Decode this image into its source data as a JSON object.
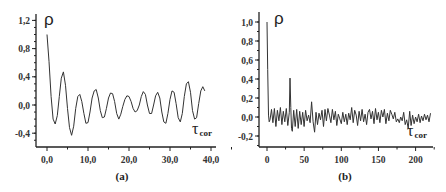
{
  "chart_data": [
    {
      "panel": "(a)",
      "type": "line",
      "title": "",
      "ylabel": "ρ",
      "xlabel": "τcor",
      "xlabel_main": "τ",
      "xlabel_sub": "cor",
      "xlim": [
        -1.5,
        41
      ],
      "ylim": [
        -0.55,
        1.3
      ],
      "xticks": [
        0,
        10,
        20,
        30,
        40
      ],
      "xtick_labels": [
        "0,0",
        "10,0",
        "20,0",
        "30,0",
        "40,0"
      ],
      "yticks": [
        1.2,
        0.8,
        0.4,
        0.0,
        -0.4
      ],
      "ytick_labels": [
        "1,2",
        "0,8",
        "0,4",
        "0,0",
        "-0,4"
      ],
      "grid": false,
      "x": [
        0,
        0.5,
        1,
        1.5,
        2,
        2.5,
        3,
        3.5,
        4,
        4.5,
        5,
        5.5,
        6,
        6.5,
        7,
        7.5,
        8,
        8.5,
        9,
        9.5,
        10,
        10.5,
        11,
        11.5,
        12,
        12.5,
        13,
        13.5,
        14,
        14.5,
        15,
        15.5,
        16,
        16.5,
        17,
        17.5,
        18,
        18.5,
        19,
        19.5,
        20,
        20.5,
        21,
        21.5,
        22,
        22.5,
        23,
        23.5,
        24,
        24.5,
        25,
        25.5,
        26,
        26.5,
        27,
        27.5,
        28,
        28.5,
        29,
        29.5,
        30,
        30.5,
        31,
        31.5,
        32,
        32.5,
        33,
        33.5,
        34,
        34.5,
        35,
        35.5,
        36,
        36.5,
        37,
        37.5,
        38,
        38.5,
        39,
        39.5,
        40
      ],
      "values": [
        1.0,
        0.62,
        0.12,
        -0.2,
        -0.27,
        -0.15,
        0.12,
        0.38,
        0.47,
        0.28,
        -0.05,
        -0.32,
        -0.43,
        -0.3,
        -0.05,
        0.12,
        0.15,
        0.05,
        -0.12,
        -0.26,
        -0.25,
        -0.1,
        0.1,
        0.2,
        0.22,
        0.1,
        -0.08,
        -0.18,
        -0.17,
        -0.05,
        0.1,
        0.17,
        0.16,
        0.05,
        -0.12,
        -0.2,
        -0.13,
        -0.02,
        0.08,
        0.13,
        0.12,
        0.05,
        -0.05,
        -0.1,
        -0.08,
        0.0,
        0.12,
        0.19,
        0.15,
        0.0,
        -0.12,
        -0.12,
        0.0,
        0.13,
        0.18,
        0.1,
        -0.1,
        -0.24,
        -0.26,
        -0.12,
        0.08,
        0.2,
        0.18,
        0.02,
        -0.18,
        -0.24,
        -0.12,
        0.12,
        0.3,
        0.33,
        0.18,
        -0.08,
        -0.2,
        -0.18,
        0.02,
        0.2,
        0.26,
        0.2
      ],
      "legend": []
    },
    {
      "panel": "(b)",
      "type": "line",
      "title": "",
      "ylabel": "ρ",
      "xlabel": "τcor",
      "xlabel_main": "τ",
      "xlabel_sub": "cor",
      "xlim": [
        -10,
        222
      ],
      "ylim": [
        -0.3,
        1.1
      ],
      "xticks": [
        0,
        50,
        100,
        150,
        200
      ],
      "xtick_labels": [
        "0",
        "50",
        "100",
        "150",
        "200"
      ],
      "yticks": [
        1.0,
        0.8,
        0.6,
        0.4,
        0.2,
        0.0,
        -0.2
      ],
      "ytick_labels": [
        "1,0",
        "0,8",
        "0,6",
        "0,4",
        "0,2",
        "0,0",
        "-0,2"
      ],
      "grid": false,
      "x": [
        0,
        1,
        2,
        3,
        4,
        6,
        8,
        10,
        12,
        14,
        16,
        18,
        20,
        22,
        24,
        26,
        28,
        30,
        31,
        32,
        33,
        34,
        36,
        38,
        40,
        42,
        44,
        46,
        48,
        50,
        52,
        54,
        56,
        58,
        60,
        62,
        64,
        66,
        68,
        70,
        72,
        74,
        76,
        78,
        80,
        82,
        84,
        86,
        88,
        90,
        92,
        94,
        96,
        98,
        100,
        102,
        104,
        106,
        108,
        110,
        112,
        114,
        116,
        118,
        120,
        122,
        124,
        126,
        128,
        130,
        132,
        134,
        136,
        138,
        140,
        142,
        144,
        146,
        148,
        150,
        152,
        154,
        156,
        158,
        160,
        162,
        164,
        166,
        168,
        170,
        172,
        174,
        176,
        178,
        180,
        182,
        184,
        186,
        188,
        190,
        192,
        194,
        196,
        198,
        200,
        202,
        204,
        206,
        208,
        210,
        212,
        214,
        216,
        218,
        220
      ],
      "values": [
        1.0,
        0.5,
        0.02,
        -0.05,
        -0.03,
        0.08,
        -0.06,
        0.09,
        -0.1,
        0.07,
        -0.04,
        0.1,
        -0.08,
        0.06,
        -0.05,
        0.09,
        -0.09,
        0.05,
        0.41,
        0.1,
        -0.12,
        -0.15,
        0.07,
        -0.1,
        0.08,
        -0.12,
        0.06,
        -0.08,
        0.05,
        -0.1,
        0.07,
        -0.04,
        0.02,
        -0.06,
        0.16,
        -0.05,
        -0.16,
        0.05,
        -0.08,
        0.04,
        -0.03,
        0.07,
        -0.1,
        0.08,
        -0.04,
        0.09,
        0.02,
        -0.06,
        0.08,
        -0.03,
        0.06,
        -0.09,
        0.03,
        -0.02,
        -0.07,
        0.05,
        -0.05,
        0.03,
        -0.08,
        0.04,
        -0.03,
        0.1,
        -0.06,
        0.07,
        0.02,
        -0.09,
        0.06,
        -0.04,
        0.08,
        -0.05,
        0.03,
        -0.08,
        0.05,
        0.08,
        -0.02,
        0.06,
        -0.07,
        0.09,
        -0.03,
        0.05,
        -0.06,
        0.07,
        0.0,
        0.08,
        -0.07,
        0.04,
        -0.04,
        0.07,
        0.03,
        -0.02,
        0.05,
        -0.05,
        -0.02,
        -0.06,
        0.0,
        -0.04,
        0.05,
        -0.08,
        -0.03,
        -0.12,
        0.06,
        -0.09,
        0.02,
        -0.07,
        0.0,
        -0.05,
        0.03,
        -0.06,
        0.01,
        -0.04,
        0.03,
        -0.03,
        0.02,
        -0.05,
        0.04
      ],
      "legend": []
    }
  ]
}
